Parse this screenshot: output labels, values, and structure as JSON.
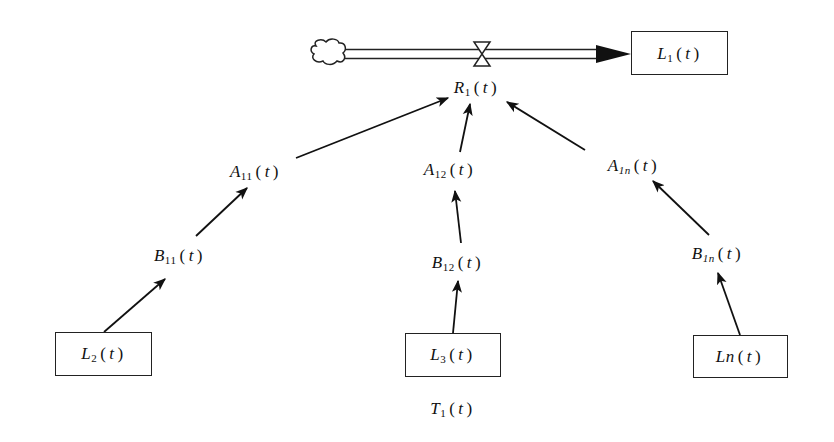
{
  "diagram": {
    "type": "system-dynamics-flow-diagram",
    "stock_top": {
      "base": "L",
      "sub": "1",
      "arg": "t"
    },
    "rate": {
      "base": "R",
      "sub": "1",
      "arg": "t"
    },
    "auxiliaries_a": [
      {
        "base": "A",
        "sub": "11",
        "arg": "t"
      },
      {
        "base": "A",
        "sub": "12",
        "arg": "t"
      },
      {
        "base": "A",
        "sub": "1n",
        "arg": "t"
      }
    ],
    "auxiliaries_b": [
      {
        "base": "B",
        "sub": "11",
        "arg": "t"
      },
      {
        "base": "B",
        "sub": "12",
        "arg": "t"
      },
      {
        "base": "B",
        "sub": "1n",
        "arg": "t"
      }
    ],
    "stocks_bottom": [
      {
        "base": "L",
        "sub": "2",
        "arg": "t"
      },
      {
        "base": "L",
        "sub": "3",
        "arg": "t"
      },
      {
        "base": "Ln",
        "sub": "",
        "arg": "t"
      }
    ],
    "caption": {
      "base": "T",
      "sub": "1",
      "arg": "t"
    },
    "links": [
      "cloud -> L1(t) (flow via R1(t) valve)",
      "A11(t) -> R1(t)",
      "A12(t) -> R1(t)",
      "A1n(t) -> R1(t)",
      "B11(t) -> A11(t)",
      "B12(t) -> A12(t)",
      "B1n(t) -> A1n(t)",
      "L2(t) -> B11(t)",
      "L3(t) -> B12(t)",
      "Ln(t) -> B1n(t)"
    ],
    "colors": {
      "line": "#111111",
      "background": "#ffffff"
    }
  }
}
